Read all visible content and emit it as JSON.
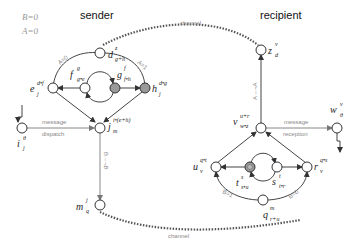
{
  "flags": {
    "b": "B=0",
    "a": "A=0"
  },
  "sender": {
    "title": "sender",
    "nodes": {
      "d": {
        "base": "d",
        "sup": "z",
        "sub": "g+h"
      },
      "e": {
        "base": "e",
        "sup": "d•f",
        "sub": "j"
      },
      "f": {
        "base": "f",
        "sup": "g",
        "sub": "g•e"
      },
      "g": {
        "base": "g",
        "sup": "f",
        "sub": "f•h"
      },
      "h": {
        "base": "h",
        "sup": "d•g",
        "sub": "j"
      },
      "i": {
        "base": "i",
        "sup": "θ",
        "sub": "j"
      },
      "j": {
        "base": "j",
        "sup": "i•(e+h)",
        "sub": "m"
      },
      "m": {
        "base": "m",
        "sup": "j",
        "sub": "q"
      }
    },
    "edge_labels": {
      "a0": "A=0",
      "a1": "A=1",
      "b_not_b": "B→¬B",
      "message": "message",
      "dispatch": "dispatch"
    }
  },
  "recipient": {
    "title": "recipient",
    "nodes": {
      "z": {
        "base": "z",
        "sup": "v",
        "sub": "d"
      },
      "v": {
        "base": "v",
        "sup": "u+r",
        "sub": "w•z"
      },
      "w": {
        "base": "w",
        "sup": "v",
        "sub": "θ"
      },
      "u": {
        "base": "u",
        "sup": "q•t",
        "sub": "v"
      },
      "t": {
        "base": "t",
        "sup": "s",
        "sub": "s•u"
      },
      "s": {
        "base": "s",
        "sup": "t",
        "sub": "t•r"
      },
      "r": {
        "base": "r",
        "sup": "q•s",
        "sub": "v"
      },
      "q": {
        "base": "q",
        "sup": "m",
        "sub": "r+u"
      }
    },
    "edge_labels": {
      "a_not_a": "A→¬A",
      "b1": "B=1",
      "b0": "B=0",
      "message": "message",
      "reception": "reception"
    }
  },
  "channels": {
    "top": "channel",
    "bottom": "channel"
  },
  "colors": {
    "node_fill": "#ffffff",
    "shaded_node": "#999999",
    "channel": "#555555",
    "label_gray": "#888888"
  }
}
